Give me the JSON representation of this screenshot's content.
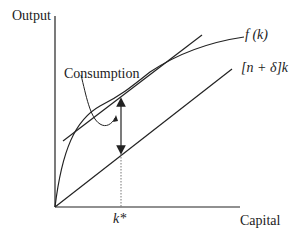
{
  "axes": {
    "y_label": "Output",
    "x_label": "Capital",
    "x_tick_label": "k*"
  },
  "curves": {
    "production": "f (k)",
    "investment_line": "[n + δ]k"
  },
  "annotations": {
    "consumption": "Consumption"
  },
  "colors": {
    "stroke": "#222222",
    "background": "#ffffff"
  }
}
